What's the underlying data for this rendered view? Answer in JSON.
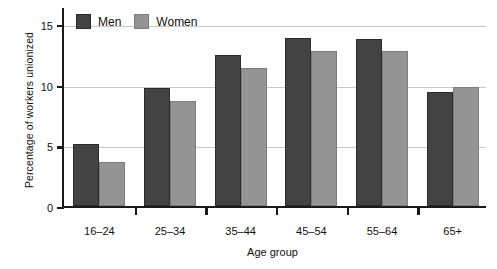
{
  "chart_data": {
    "type": "bar",
    "title": "",
    "xlabel": "Age group",
    "ylabel": "Percentage of workers unionized",
    "categories": [
      "16–24",
      "25–34",
      "35–44",
      "45–54",
      "55–64",
      "65+"
    ],
    "series": [
      {
        "name": "Men",
        "color": "#434343",
        "values": [
          5.1,
          9.7,
          12.5,
          13.9,
          13.8,
          9.4
        ]
      },
      {
        "name": "Women",
        "color": "#949494",
        "values": [
          3.6,
          8.7,
          11.4,
          12.8,
          12.8,
          9.8
        ]
      }
    ],
    "ylim": [
      0,
      16.5
    ],
    "yticks": [
      0,
      5,
      10,
      15
    ],
    "ytick_labels": [
      "0",
      "5",
      "10",
      "15"
    ],
    "grid": true,
    "legend_position": "top-left"
  },
  "legend": {
    "items": [
      {
        "label": "Men",
        "swatch": "men"
      },
      {
        "label": "Women",
        "swatch": "women"
      }
    ]
  }
}
